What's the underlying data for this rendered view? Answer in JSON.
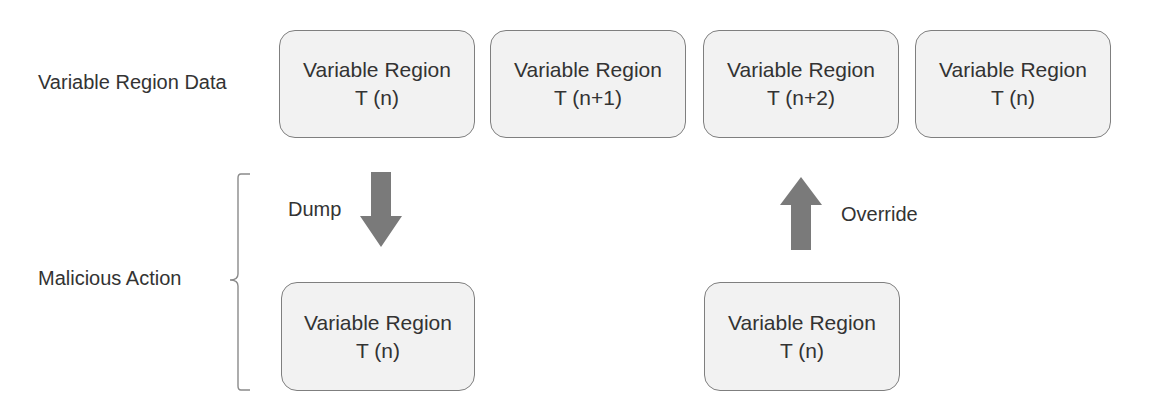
{
  "row_labels": {
    "data": "Variable Region Data",
    "action": "Malicious Action"
  },
  "top_row": [
    {
      "title": "Variable Region",
      "time": "T (n)"
    },
    {
      "title": "Variable Region",
      "time": "T (n+1)"
    },
    {
      "title": "Variable Region",
      "time": "T (n+2)"
    },
    {
      "title": "Variable Region",
      "time": "T (n)"
    }
  ],
  "bottom_row": [
    {
      "title": "Variable Region",
      "time": "T (n)"
    },
    {
      "title": "Variable Region",
      "time": "T (n)"
    }
  ],
  "arrows": {
    "dump": {
      "label": "Dump",
      "direction": "down"
    },
    "override": {
      "label": "Override",
      "direction": "up"
    }
  },
  "colors": {
    "box_fill": "#f2f2f2",
    "box_border": "#7f7f7f",
    "arrow_fill": "#7a7a7a",
    "text": "#333333"
  }
}
